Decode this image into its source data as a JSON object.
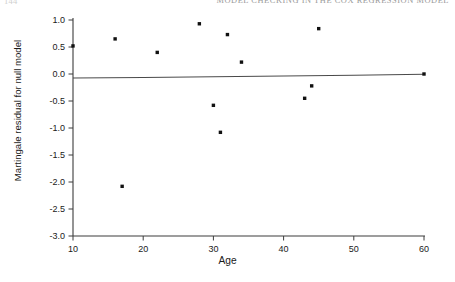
{
  "page": {
    "folio": "144",
    "running_title": "MODEL CHECKING IN THE COX REGRESSION MODEL"
  },
  "figure": {
    "xlabel": "Age",
    "ylabel": "Martingale residual for null model"
  },
  "chart_data": {
    "type": "scatter",
    "title": "",
    "subtitle": "",
    "xlabel": "Age",
    "ylabel": "Martingale residual for null model",
    "xlim": [
      10,
      60
    ],
    "ylim": [
      -3.0,
      1.0
    ],
    "xticks": [
      10,
      20,
      30,
      40,
      50,
      60
    ],
    "xticklabels": [
      "10",
      "20",
      "30",
      "40",
      "50",
      "60"
    ],
    "yticks": [
      1.0,
      0.5,
      0.0,
      -0.5,
      -1.0,
      -1.5,
      -2.0,
      -2.5,
      -3.0
    ],
    "yticklabels": [
      "1.0",
      "0.5",
      "0.0",
      "-0.5",
      "-1.0",
      "-1.5",
      "-2.0",
      "-2.5",
      "-3.0"
    ],
    "grid": false,
    "legend": false,
    "marker": "filled-square",
    "marker_color": "#111111",
    "marker_size": 3.4,
    "series": [
      {
        "name": "Martingale residuals",
        "type": "scatter",
        "x": [
          10,
          16,
          17,
          22,
          28,
          30,
          31,
          32,
          34,
          43,
          44,
          45,
          60
        ],
        "y": [
          0.52,
          0.65,
          -2.08,
          0.4,
          0.93,
          -0.58,
          -1.08,
          0.73,
          0.22,
          -0.45,
          -0.22,
          0.84,
          0.0
        ]
      },
      {
        "name": "Smoothed fit",
        "type": "line",
        "line_color": "#4a4a4a",
        "line_width": 1.1,
        "x": [
          10,
          20,
          30,
          40,
          50,
          60
        ],
        "y": [
          -0.075,
          -0.065,
          -0.052,
          -0.038,
          -0.022,
          -0.005
        ]
      }
    ]
  }
}
